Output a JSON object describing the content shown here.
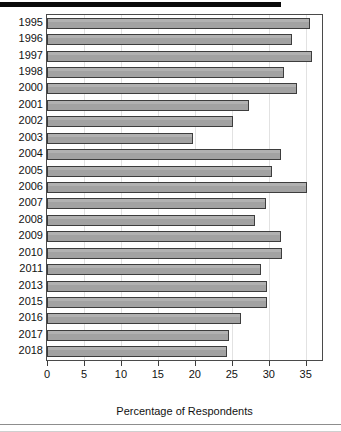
{
  "chart_data": {
    "type": "bar",
    "orientation": "horizontal",
    "title": "",
    "xlabel": "Percentage of Respondents",
    "ylabel": "",
    "xlim": [
      0,
      37.2
    ],
    "ylim": null,
    "grid": "vertical-light",
    "legend": "none",
    "xticks": [
      0,
      5,
      10,
      15,
      20,
      25,
      30,
      35
    ],
    "xticklabels": [
      "0",
      "5",
      "10",
      "15",
      "20",
      "25",
      "30",
      "35"
    ],
    "categories": [
      "1995",
      "1996",
      "1997",
      "1998",
      "2000",
      "2001",
      "2002",
      "2003",
      "2004",
      "2005",
      "2006",
      "2007",
      "2008",
      "2009",
      "2010",
      "2011",
      "2013",
      "2015",
      "2016",
      "2017",
      "2018"
    ],
    "values": [
      35.6,
      33.1,
      35.8,
      32.1,
      33.8,
      27.3,
      25.1,
      19.8,
      31.7,
      30.5,
      35.2,
      29.6,
      28.1,
      31.6,
      31.8,
      29.0,
      29.7,
      29.7,
      26.2,
      24.6,
      24.3
    ],
    "bar_color": "#a2a2a2",
    "bar_edge_color": "#3d3d3d",
    "frame_color": "#4a4a4a",
    "background_color": "#ffffff"
  },
  "xtitle": "Percentage of Respondents"
}
